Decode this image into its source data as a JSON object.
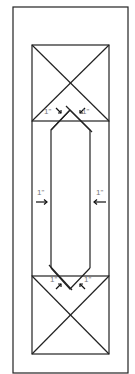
{
  "diagram": {
    "type": "door-frame-schematic",
    "labels": {
      "top_left": "1\"",
      "top_right": "1\"",
      "mid_left": "1\"",
      "mid_right": "1\"",
      "bottom_left": "1\"",
      "bottom_right": "1\""
    },
    "colors": {
      "line": "#222222",
      "label": "#777777",
      "background": "#ffffff"
    }
  }
}
